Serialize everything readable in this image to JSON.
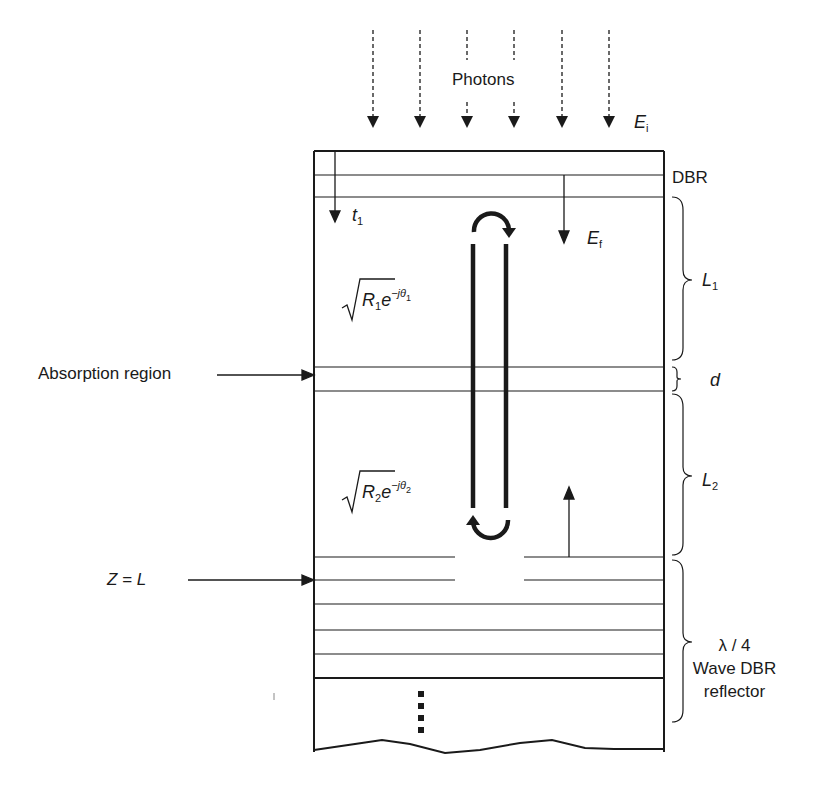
{
  "diagram": {
    "labels": {
      "photons": "Photons",
      "incident_field": {
        "main": "E",
        "sub": "i"
      },
      "top_dbr": "DBR",
      "transmission": {
        "main": "t",
        "sub": "1"
      },
      "forward_field": {
        "main": "E",
        "sub": "f"
      },
      "backward_field": {
        "main": "E",
        "sub": "b"
      },
      "top_reflection": {
        "R": "R",
        "R_sub": "1",
        "e": "e",
        "exp": "−jθ",
        "exp_sub": "1"
      },
      "bottom_reflection": {
        "R": "R",
        "R_sub": "2",
        "e": "e",
        "exp": "−jθ",
        "exp_sub": "2"
      },
      "absorption_region": "Absorption region",
      "z_equals_L": "Z = L",
      "L1": {
        "main": "L",
        "sub": "1"
      },
      "d": "d",
      "L2": {
        "main": "L",
        "sub": "2"
      },
      "bottom_dbr": {
        "line1": "λ / 4",
        "line2": "Wave DBR",
        "line3": "reflector"
      },
      "continuation": "⋮"
    },
    "colors": {
      "ink": "#1a1a1a",
      "background": "#ffffff"
    }
  }
}
